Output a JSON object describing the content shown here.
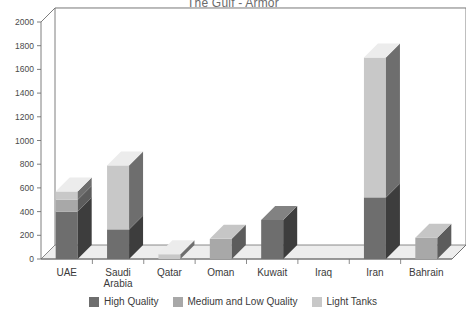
{
  "chart_data": {
    "type": "bar",
    "subtype": "stacked-3d-column",
    "title": "The Gulf - Armor",
    "xlabel": "",
    "ylabel": "",
    "ylim": [
      0,
      2000
    ],
    "ytick_step": 200,
    "yticks": [
      "0",
      "200",
      "400",
      "600",
      "800",
      "1000",
      "1200",
      "1400",
      "1600",
      "1800",
      "2000"
    ],
    "grid": true,
    "legend_position": "bottom",
    "categories": [
      "UAE",
      "Saudi Arabia",
      "Qatar",
      "Oman",
      "Kuwait",
      "Iraq",
      "Iran",
      "Bahrain"
    ],
    "series": [
      {
        "name": "High Quality",
        "color": "#6e6e6e",
        "values": [
          400,
          250,
          0,
          0,
          330,
          0,
          520,
          0
        ]
      },
      {
        "name": "Medium and Low Quality",
        "color": "#a8a8a8",
        "values": [
          100,
          0,
          0,
          170,
          0,
          0,
          0,
          180
        ]
      },
      {
        "name": "Light Tanks",
        "color": "#c8c8c8",
        "values": [
          70,
          540,
          40,
          0,
          0,
          0,
          1180,
          0
        ]
      }
    ],
    "totals": [
      570,
      790,
      40,
      170,
      330,
      0,
      1700,
      180
    ]
  },
  "colors": {
    "high_quality": "#6e6e6e",
    "medium_low_quality": "#a8a8a8",
    "light_tanks": "#c8c8c8",
    "axis": "#6f6f6f",
    "grid": "#dcdcdc",
    "floor": "#ededed",
    "background": "#ffffff"
  },
  "legend": {
    "items": [
      {
        "label": "High Quality",
        "swatch": "legend-swatch-high-quality"
      },
      {
        "label": "Medium and Low Quality",
        "swatch": "legend-swatch-medium-low-quality"
      },
      {
        "label": "Light Tanks",
        "swatch": "legend-swatch-light-tanks"
      }
    ]
  }
}
